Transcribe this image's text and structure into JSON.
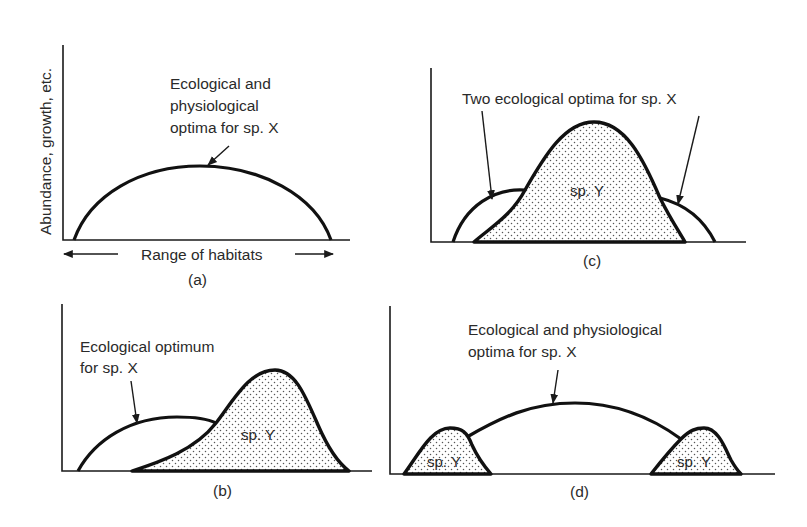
{
  "figure": {
    "y_axis_label": "Abundance, growth, etc.",
    "x_axis_label": "Range of habitats",
    "panels": {
      "a": {
        "caption": "(a)",
        "annotation_lines": [
          "Ecological and",
          "physiological",
          "optima for sp. X"
        ],
        "curves": [
          "sp. X"
        ]
      },
      "b": {
        "caption": "(b)",
        "annotation_lines": [
          "Ecological optimum",
          "for sp. X"
        ],
        "species_y_label": "sp. Y",
        "curves": [
          "sp. X",
          "sp. Y"
        ]
      },
      "c": {
        "caption": "(c)",
        "annotation_lines": [
          "Two ecological optima for sp. X"
        ],
        "species_y_label": "sp. Y",
        "curves": [
          "sp. X",
          "sp. Y"
        ]
      },
      "d": {
        "caption": "(d)",
        "annotation_lines": [
          "Ecological and physiological",
          "optima for sp. X"
        ],
        "species_y_labels": [
          "sp. Y",
          "sp. Y"
        ],
        "curves": [
          "sp. X",
          "sp. Y",
          "sp. Y"
        ]
      }
    },
    "colors": {
      "ink": "#111111",
      "stipple": "#555555",
      "background": "#ffffff"
    }
  }
}
